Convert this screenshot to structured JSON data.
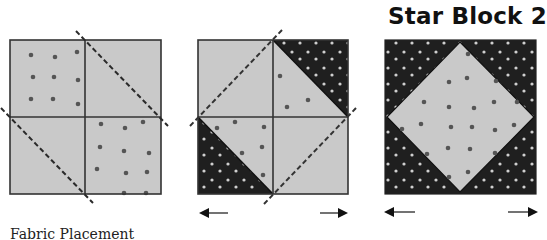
{
  "title": "Star Block 2",
  "caption": "Fabric Placement",
  "colors": {
    "light_fabric": "#c9c9c9",
    "dark_fabric": "#1f1f1f",
    "seam_line": "#333333",
    "cut_line": "#2a2a2a",
    "star_on_light": "#555555",
    "dot_on_dark": "#cfcfcf"
  },
  "steps": [
    {
      "id": "step-1",
      "description": "Four light squares, two with star print, with dashed diagonal cutting lines"
    },
    {
      "id": "step-2",
      "description": "Light squares sewn with dark star-print triangles, dashed diagonal lines form a diamond"
    },
    {
      "id": "step-3",
      "description": "Finished block: light star-print diamond (square-in-a-square) on dark star-print background"
    }
  ],
  "arrows": [
    {
      "block": "step-2",
      "left": "←",
      "right": "→"
    },
    {
      "block": "step-3",
      "left": "←",
      "right": "→"
    }
  ]
}
